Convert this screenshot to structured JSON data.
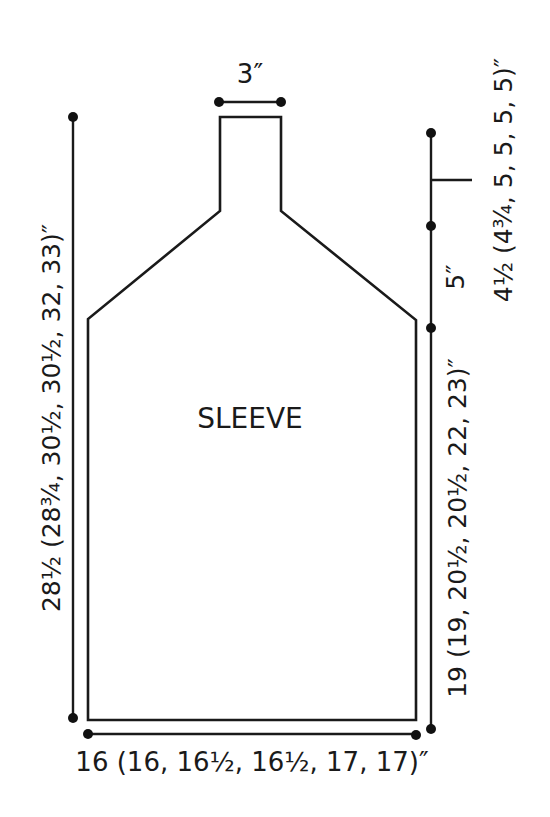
{
  "diagram": {
    "piece_label": "SLEEVE",
    "colors": {
      "line": "#1a1a1a",
      "background": "#ffffff"
    },
    "dimensions": {
      "cap_top_width": "3″",
      "total_length": "28½ (28¾, 30½, 30½, 32, 33)″",
      "cap_upper_height": "4½ (4¾, 5, 5, 5, 5)″",
      "cap_shaping_height": "5″",
      "body_length": "19 (19, 20½, 20½, 22, 23)″",
      "bottom_width": "16 (16, 16½, 16½, 17, 17)″"
    }
  }
}
